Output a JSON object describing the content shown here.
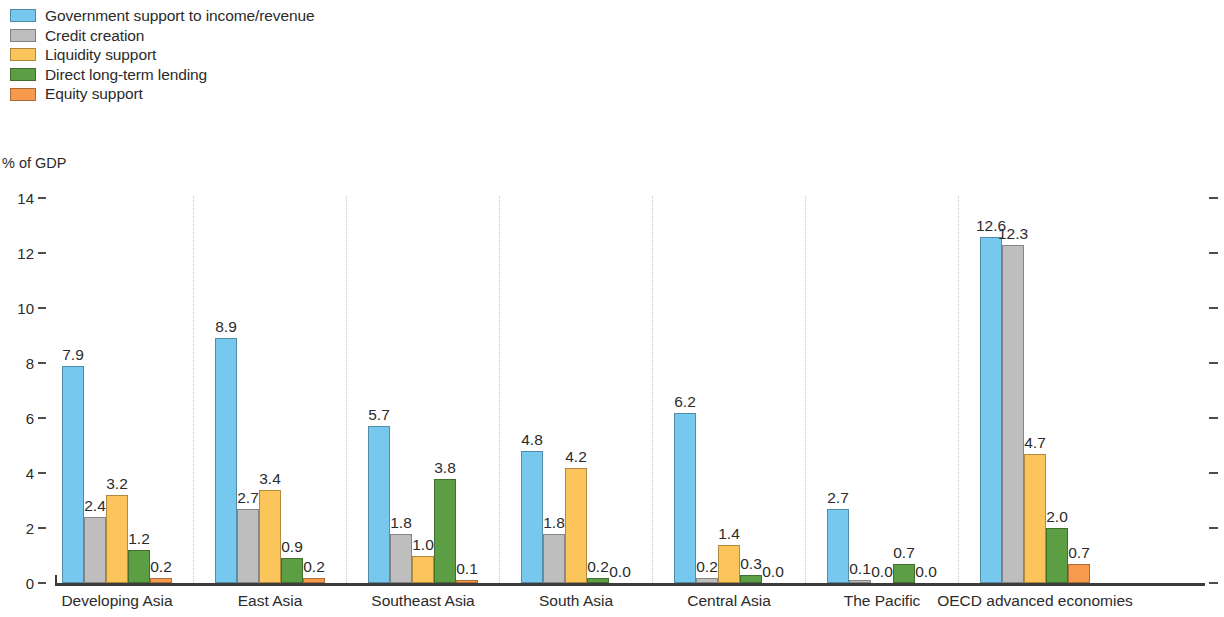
{
  "chart_data": {
    "type": "bar",
    "title": "",
    "subtitle": "",
    "xlabel": "",
    "ylabel": "% of GDP",
    "ylim": [
      0,
      14
    ],
    "ytick_values": [
      14,
      12,
      10,
      8,
      6,
      4,
      2,
      0
    ],
    "ytick_labels": [
      "14",
      "12",
      "10",
      "8",
      "6",
      "4",
      "2",
      "0"
    ],
    "grid": false,
    "group_separators": true,
    "legend_position": "top-left",
    "value_labels": true,
    "categories": [
      "Developing Asia",
      "East Asia",
      "Southeast Asia",
      "South Asia",
      "Central Asia",
      "The Pacific",
      "OECD advanced economies"
    ],
    "series": [
      {
        "name": "Government support to income/revenue",
        "color": "#76C8EE",
        "values": [
          7.9,
          8.9,
          5.7,
          4.8,
          6.2,
          2.7,
          12.6
        ],
        "labels": [
          "7.9",
          "8.9",
          "5.7",
          "4.8",
          "6.2",
          "2.7",
          "12.6"
        ]
      },
      {
        "name": "Credit creation",
        "color": "#BEBEBE",
        "values": [
          2.4,
          2.7,
          1.8,
          1.8,
          0.2,
          0.1,
          12.3
        ],
        "labels": [
          "2.4",
          "2.7",
          "1.8",
          "1.8",
          "0.2",
          "0.1",
          "12.3"
        ]
      },
      {
        "name": "Liquidity support",
        "color": "#FCC55B",
        "values": [
          3.2,
          3.4,
          1.0,
          4.2,
          1.4,
          0.0,
          4.7
        ],
        "labels": [
          "3.2",
          "3.4",
          "1.0",
          "4.2",
          "1.4",
          "0.0",
          "4.7"
        ]
      },
      {
        "name": "Direct long-term lending",
        "color": "#5C9E44",
        "values": [
          1.2,
          0.9,
          3.8,
          0.2,
          0.3,
          0.7,
          2.0
        ],
        "labels": [
          "1.2",
          "0.9",
          "3.8",
          "0.2",
          "0.3",
          "0.7",
          "2.0"
        ]
      },
      {
        "name": "Equity support",
        "color": "#F79A4E",
        "values": [
          0.2,
          0.2,
          0.1,
          0.0,
          0.0,
          0.0,
          0.7
        ],
        "labels": [
          "0.2",
          "0.2",
          "0.1",
          "0.0",
          "0.0",
          "0.0",
          "0.7"
        ]
      }
    ]
  }
}
